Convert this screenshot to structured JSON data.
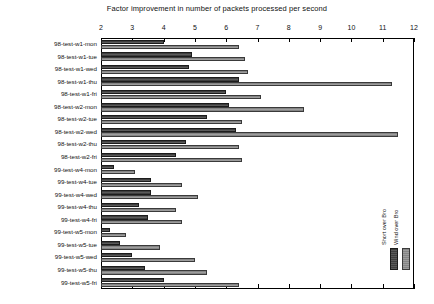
{
  "chart_data": {
    "type": "bar",
    "orientation": "horizontal",
    "title": "Factor improvement in number of packets processed per second",
    "xlabel": "",
    "ylabel": "",
    "xlim": [
      2,
      12
    ],
    "xticks": [
      2,
      3,
      4,
      5,
      6,
      7,
      8,
      9,
      10,
      11,
      12
    ],
    "grid": false,
    "legend_position": "bottom-right",
    "categories": [
      "98-test-w1-mon",
      "98-test-w1-tue",
      "98-test-w1-wed",
      "98-test-w1-thu",
      "98-test-w1-fri",
      "98-test-w2-mon",
      "98-test-w2-tue",
      "98-test-w2-wed",
      "98-test-w2-thu",
      "98-test-w2-fri",
      "99-test-w4-mon",
      "99-test-w4-tue",
      "99-test-w4-wed",
      "99-test-w4-thu",
      "99-test-w4-fri",
      "99-test-w5-mon",
      "99-test-w5-tue",
      "99-test-w5-wed",
      "99-test-w5-thu",
      "99-test-w5-fri"
    ],
    "series": [
      {
        "name": "Short over Bro",
        "color": "#4a4a4a",
        "values": [
          4.0,
          4.9,
          4.8,
          6.4,
          6.0,
          6.1,
          5.4,
          6.3,
          4.7,
          4.4,
          2.4,
          3.6,
          3.6,
          3.2,
          3.5,
          2.3,
          2.6,
          3.0,
          3.4,
          4.0
        ]
      },
      {
        "name": "Wind over Bro",
        "color": "#8e8e8e",
        "values": [
          6.4,
          6.6,
          6.7,
          11.3,
          7.1,
          8.5,
          6.5,
          11.5,
          6.4,
          6.5,
          3.1,
          4.6,
          5.1,
          4.4,
          4.6,
          2.8,
          3.9,
          5.0,
          5.4,
          6.4
        ]
      }
    ]
  },
  "legend": {
    "entries": [
      {
        "label": "Short over Bro"
      },
      {
        "label": "Wind over Bro"
      }
    ]
  }
}
